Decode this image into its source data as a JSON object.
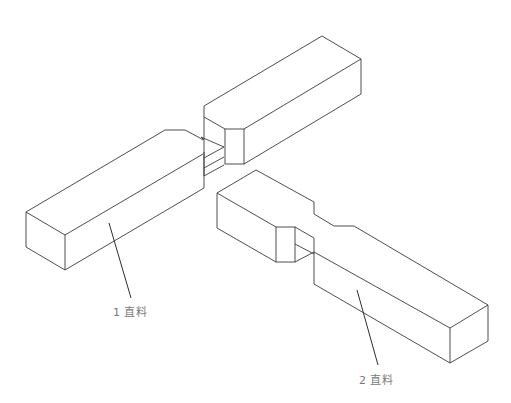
{
  "diagram": {
    "type": "isometric joinery drawing",
    "colors": {
      "line": "#3a3a3a",
      "label": "#7a7a7a",
      "background": "#ffffff"
    },
    "parts": [
      {
        "id": "part-1",
        "number": "1",
        "name": "直料",
        "label": "1 直料"
      },
      {
        "id": "part-2",
        "number": "2",
        "name": "直料",
        "label": "2 直料"
      }
    ]
  }
}
